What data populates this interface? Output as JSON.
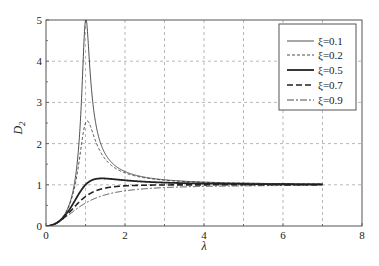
{
  "chart_data": {
    "type": "line",
    "title": "",
    "xlabel": "λ",
    "ylabel": "D2",
    "ylabel_main": "D",
    "ylabel_sub": "2",
    "xlim": [
      0,
      8
    ],
    "ylim": [
      0,
      5
    ],
    "xticks": [
      "0",
      "2",
      "4",
      "6",
      "8"
    ],
    "yticks": [
      "0",
      "1",
      "2",
      "3",
      "4",
      "5"
    ],
    "grid": true,
    "legend_position": "upper right",
    "formula": "D2 = λ^2 / sqrt((1-λ^2)^2 + (2ξλ)^2)",
    "x_range_plotted": [
      0,
      7
    ],
    "series": [
      {
        "name": "ξ=0.1",
        "xi": 0.1,
        "style": "solid-thin",
        "peak": {
          "x": 1.0,
          "y": 5.0
        },
        "sample_points": [
          [
            0,
            0
          ],
          [
            0.5,
            0.33
          ],
          [
            0.8,
            1.68
          ],
          [
            0.9,
            3.4
          ],
          [
            1.0,
            5.0
          ],
          [
            1.2,
            2.54
          ],
          [
            1.5,
            1.77
          ],
          [
            2,
            1.33
          ],
          [
            3,
            1.12
          ],
          [
            4,
            1.07
          ],
          [
            5,
            1.04
          ],
          [
            7,
            1.02
          ]
        ]
      },
      {
        "name": "ξ=0.2",
        "xi": 0.2,
        "style": "dashed-thin",
        "peak": {
          "x": 1.05,
          "y": 2.55
        },
        "sample_points": [
          [
            0,
            0
          ],
          [
            0.5,
            0.33
          ],
          [
            0.8,
            1.48
          ],
          [
            1.0,
            2.5
          ],
          [
            1.2,
            2.04
          ],
          [
            1.5,
            1.67
          ],
          [
            2,
            1.3
          ],
          [
            3,
            1.12
          ],
          [
            4,
            1.06
          ],
          [
            5,
            1.04
          ],
          [
            7,
            1.02
          ]
        ]
      },
      {
        "name": "ξ=0.5",
        "xi": 0.5,
        "style": "solid-thick",
        "peak": {
          "x": 1.41,
          "y": 1.15
        },
        "sample_points": [
          [
            0,
            0
          ],
          [
            0.5,
            0.28
          ],
          [
            0.8,
            0.8
          ],
          [
            1.0,
            1.0
          ],
          [
            1.4,
            1.15
          ],
          [
            2,
            1.11
          ],
          [
            3,
            1.05
          ],
          [
            4,
            1.03
          ],
          [
            5,
            1.02
          ],
          [
            7,
            1.01
          ]
        ]
      },
      {
        "name": "ξ=0.7",
        "xi": 0.7,
        "style": "dashed-thick",
        "sample_points": [
          [
            0,
            0
          ],
          [
            0.5,
            0.25
          ],
          [
            0.8,
            0.6
          ],
          [
            1.0,
            0.71
          ],
          [
            1.5,
            0.92
          ],
          [
            2,
            0.97
          ],
          [
            3,
            0.99
          ],
          [
            4,
            1.0
          ],
          [
            5,
            1.0
          ],
          [
            7,
            1.0
          ]
        ]
      },
      {
        "name": "ξ=0.9",
        "xi": 0.9,
        "style": "dashdot-thin",
        "sample_points": [
          [
            0,
            0
          ],
          [
            0.5,
            0.22
          ],
          [
            0.8,
            0.47
          ],
          [
            1.0,
            0.56
          ],
          [
            1.5,
            0.8
          ],
          [
            2,
            0.9
          ],
          [
            3,
            0.96
          ],
          [
            4,
            0.98
          ],
          [
            5,
            0.99
          ],
          [
            7,
            1.0
          ]
        ]
      }
    ]
  },
  "legend": {
    "items": [
      {
        "label": "ξ=0.1"
      },
      {
        "label": "ξ=0.2"
      },
      {
        "label": "ξ=0.5"
      },
      {
        "label": "ξ=0.7"
      },
      {
        "label": "ξ=0.9"
      }
    ]
  },
  "colors": {
    "line": "#222222",
    "grid": "#888888",
    "axis": "#555555",
    "background": "#ffffff"
  }
}
